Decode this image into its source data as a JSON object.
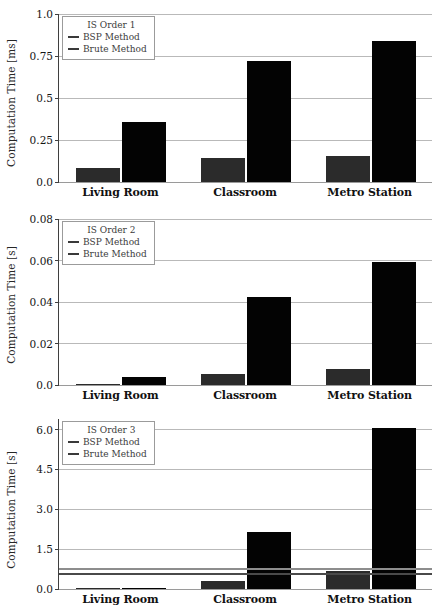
{
  "figure": {
    "categories": [
      "Living Room",
      "Classroom",
      "Metro Station"
    ],
    "series_names": [
      "BSP Method",
      "Brute Method"
    ],
    "colors": {
      "bsp_bar": "#2b2b2b",
      "brute_bar": "#030303",
      "bsp_line": "#4a4a4a",
      "brute_line": "#8d8d8d",
      "grid": "#b9b9b9",
      "axis": "#3f3f3f",
      "background": "#ffffff"
    }
  },
  "chart_data": [
    {
      "type": "bar",
      "title": "IS Order 1",
      "xlabel": "",
      "ylabel": "Computation Time [ms]",
      "categories": [
        "Living Room",
        "Classroom",
        "Metro Station"
      ],
      "series": [
        {
          "name": "BSP Method",
          "values": [
            0.085,
            0.142,
            0.157
          ]
        },
        {
          "name": "Brute Method",
          "values": [
            0.358,
            0.722,
            0.838
          ]
        }
      ],
      "ylim": [
        0.0,
        1.0
      ],
      "yticks": [
        0.0,
        0.25,
        0.5,
        0.75,
        1.0
      ],
      "ytick_labels": [
        "0.0",
        "0.25",
        "0.5",
        "0.75",
        "1.0"
      ],
      "grid": true,
      "legend_position": "upper left",
      "legend_title": "IS Order 1",
      "hlines": []
    },
    {
      "type": "bar",
      "title": "IS Order 2",
      "xlabel": "",
      "ylabel": "Computation Time [s]",
      "categories": [
        "Living Room",
        "Classroom",
        "Metro Station"
      ],
      "series": [
        {
          "name": "BSP Method",
          "values": [
            0.0004,
            0.0054,
            0.0077
          ]
        },
        {
          "name": "Brute Method",
          "values": [
            0.0037,
            0.0423,
            0.0592
          ]
        }
      ],
      "ylim": [
        0.0,
        0.08
      ],
      "yticks": [
        0.0,
        0.02,
        0.04,
        0.06,
        0.08
      ],
      "ytick_labels": [
        "0.0",
        "0.02",
        "0.04",
        "0.06",
        "0.08"
      ],
      "grid": true,
      "legend_position": "upper left",
      "legend_title": "IS Order 2",
      "hlines": []
    },
    {
      "type": "bar",
      "title": "IS Order 3",
      "xlabel": "",
      "ylabel": "Computation Time [s]",
      "categories": [
        "Living Room",
        "Classroom",
        "Metro Station"
      ],
      "series": [
        {
          "name": "BSP Method",
          "values": [
            0.02,
            0.3,
            0.67
          ]
        },
        {
          "name": "Brute Method",
          "values": [
            0.03,
            2.15,
            6.05
          ]
        }
      ],
      "ylim": [
        0.0,
        6.4
      ],
      "yticks": [
        0.0,
        1.5,
        3.0,
        4.5,
        6.0
      ],
      "ytick_labels": [
        "0.0",
        "1.5",
        "3.0",
        "4.5",
        "6.0"
      ],
      "grid": true,
      "legend_position": "upper left",
      "legend_title": "IS Order 3",
      "hlines": [
        {
          "name": "Brute Method",
          "value": 0.77,
          "color": "#8d8d8d"
        },
        {
          "name": "BSP Method",
          "value": 0.56,
          "color": "#4a4a4a"
        }
      ]
    }
  ]
}
